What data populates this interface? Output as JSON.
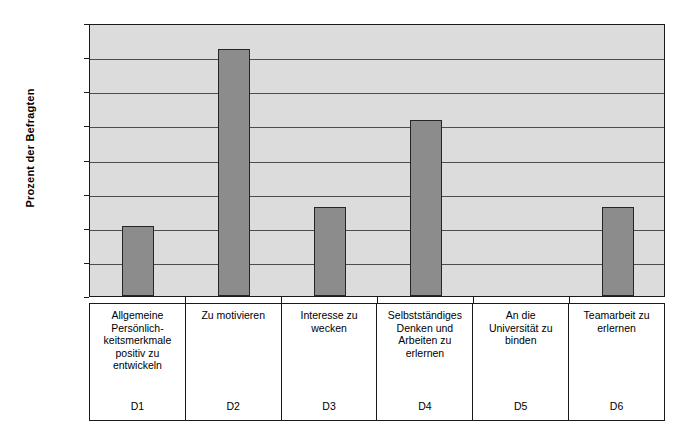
{
  "chart_data": {
    "type": "bar",
    "title": "",
    "xlabel": "",
    "ylabel": "Prozent der Befragten",
    "ylim": [
      0,
      16
    ],
    "ytick_step": 2,
    "grid": true,
    "legend": "none",
    "bar_fill_color": "#8c8c8c",
    "bar_border_color": "#262626",
    "plot_background_color": "#dcdcdc",
    "axis_color": "#1a1a1a",
    "categories": [
      "D1",
      "D2",
      "D3",
      "D4",
      "D5",
      "D6"
    ],
    "category_labels": [
      "Allgemeine\nPersönlich-\nkeitsmerkmale\npositiv zu\nentwickeln",
      "Zu motivieren",
      "Interesse zu\nwecken",
      "Selbstständiges\nDenken und\nArbeiten zu\nerlernen",
      "An die\nUniversität zu\nbinden",
      "Teamarbeit zu\nerlernen"
    ],
    "values": [
      4.1,
      14.5,
      5.2,
      10.3,
      0,
      5.2
    ],
    "ytick_labels": [
      "16,00",
      "14,00",
      "12,00",
      "10,00",
      "8,00",
      "6,00",
      "4,00",
      "2,00",
      "0,00"
    ],
    "ytick_values": [
      16,
      14,
      12,
      10,
      8,
      6,
      4,
      2,
      0
    ]
  }
}
